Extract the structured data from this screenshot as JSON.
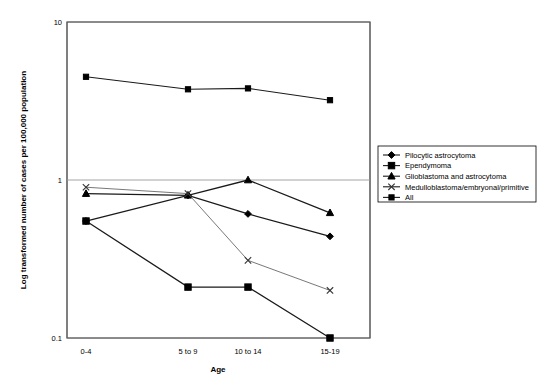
{
  "chart_data": {
    "type": "line",
    "title": "",
    "xlabel": "Age",
    "ylabel": "Log transformed number of cases per 100,000 population",
    "categories": [
      "0-4",
      "5 to 9",
      "10 to 14",
      "15-19"
    ],
    "yscale": "log",
    "ylim": [
      0.1,
      10
    ],
    "ytick_labels": [
      "10",
      "1",
      "0.1"
    ],
    "ytick_values": [
      10,
      1,
      0.1
    ],
    "grid": "horizontal",
    "legend_position": "right",
    "series": [
      {
        "name": "Pilocytic astrocytoma",
        "marker": "diamond",
        "values": [
          0.55,
          0.8,
          0.61,
          0.44
        ]
      },
      {
        "name": "Ependymoma",
        "marker": "square",
        "values": [
          0.55,
          0.21,
          0.21,
          0.1
        ]
      },
      {
        "name": "Glioblastoma and astrocytoma",
        "marker": "triangle",
        "values": [
          0.82,
          0.8,
          1.0,
          0.62
        ]
      },
      {
        "name": "Medulloblastoma/embryonal/primitive",
        "marker": "cross",
        "values": [
          0.9,
          0.82,
          0.31,
          0.2
        ]
      },
      {
        "name": "All",
        "marker": "square-small",
        "values": [
          4.5,
          3.75,
          3.8,
          3.2
        ]
      }
    ]
  },
  "colors": {
    "line": "#1a1a1a",
    "grid": "#9a9a9a",
    "frame": "#000000",
    "background": "#ffffff"
  }
}
